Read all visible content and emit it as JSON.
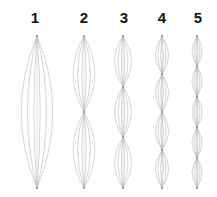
{
  "diagram": {
    "line_color": "#b8b8b8",
    "pinch_color": "#8a8a8a",
    "label_color": "#111111",
    "top_y": 36,
    "bottom_y": 188,
    "strands_per_lens": 6,
    "columns": [
      {
        "label": "1",
        "cx": 37,
        "width": 38,
        "segments": 1
      },
      {
        "label": "2",
        "cx": 84,
        "width": 26,
        "segments": 2
      },
      {
        "label": "3",
        "cx": 123,
        "width": 20,
        "segments": 3
      },
      {
        "label": "4",
        "cx": 162,
        "width": 16,
        "segments": 4
      },
      {
        "label": "5",
        "cx": 197,
        "width": 12,
        "segments": 5
      }
    ]
  }
}
